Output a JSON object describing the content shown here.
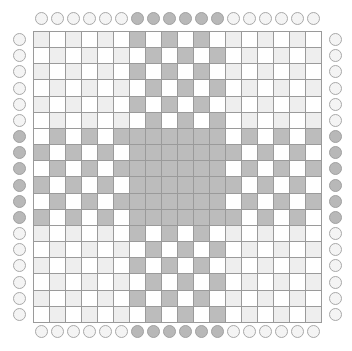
{
  "board": {
    "rows": 18,
    "cols": 18,
    "colors": {
      "dark": "#bcbcbc",
      "light": "#eeeeee",
      "white": "#ffffff",
      "grid_line": "#9a9a9a",
      "clue_on": "#b8b8b8",
      "clue_off": "#f4f4f4"
    },
    "cells": [
      "LWLWLWDWDWDWLWLWLW",
      "WLWLWLWDWDWDWLWLWL",
      "LWLWLWDWDWDWLWLWLW",
      "WLWLWLWDWDWDWLWLWL",
      "LWLWLWDWDWDWLWLWLW",
      "WLWLWLWDWDWDWLWLWL",
      "WDWDWDDDDDDDWDWDWD",
      "DWDWDWDDDDDDDWDWDW",
      "WDWDWDDDDDDDWDWDWD",
      "DWDWDWDDDDDDDWDWDW",
      "WDWDWDDDDDDDWDWDWD",
      "DWDWDWDDDDDDDWDWDW",
      "LWLWLWDWDWDWLWLWLW",
      "WLWLWLWDWDWDWLWLWL",
      "LWLWLWDWDWDWLWLWLW",
      "WLWLWLWDWDWDWLWLWL",
      "LWLWLWDWDWDWLWLWLW",
      "WLWLWLWDWDWDWLWLWL"
    ],
    "clues": {
      "top": [
        0,
        0,
        0,
        0,
        0,
        0,
        1,
        1,
        1,
        1,
        1,
        1,
        0,
        0,
        0,
        0,
        0,
        0
      ],
      "bottom": [
        0,
        0,
        0,
        0,
        0,
        0,
        1,
        1,
        1,
        1,
        1,
        1,
        0,
        0,
        0,
        0,
        0,
        0
      ],
      "left": [
        0,
        0,
        0,
        0,
        0,
        0,
        1,
        1,
        1,
        1,
        1,
        1,
        0,
        0,
        0,
        0,
        0,
        0
      ],
      "right": [
        0,
        0,
        0,
        0,
        0,
        0,
        1,
        1,
        1,
        1,
        1,
        1,
        0,
        0,
        0,
        0,
        0,
        0
      ]
    }
  }
}
